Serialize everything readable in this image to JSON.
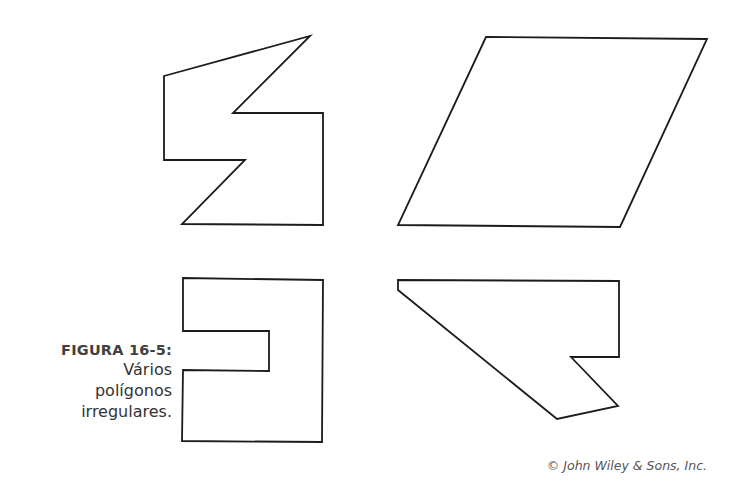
{
  "caption": {
    "label": "FIGURA 16-5:",
    "lines": [
      "Vários",
      "polígonos",
      "irregulares."
    ]
  },
  "credit": "© John Wiley & Sons, Inc.",
  "colors": {
    "stroke": "#1c1c1c",
    "caption_label": "#404040",
    "caption_text": "#333333",
    "credit_text": "#555555",
    "background": "#ffffff"
  },
  "shapes": [
    {
      "name": "zigzag-octagon",
      "points": "164,76 310,36 233,113 323,113 323,225 182,224 245,160 164,160"
    },
    {
      "name": "parallelogram",
      "points": "486,37 707,39 620,227 398,225"
    },
    {
      "name": "notched-rectangle",
      "points": "183,278 323,280 322,442 182,441 183,370 269,371 269,331 183,331"
    },
    {
      "name": "irregular-heptagon",
      "points": "398,280 619,281 619,357 571,357 618,406 557,419 398,290"
    }
  ]
}
